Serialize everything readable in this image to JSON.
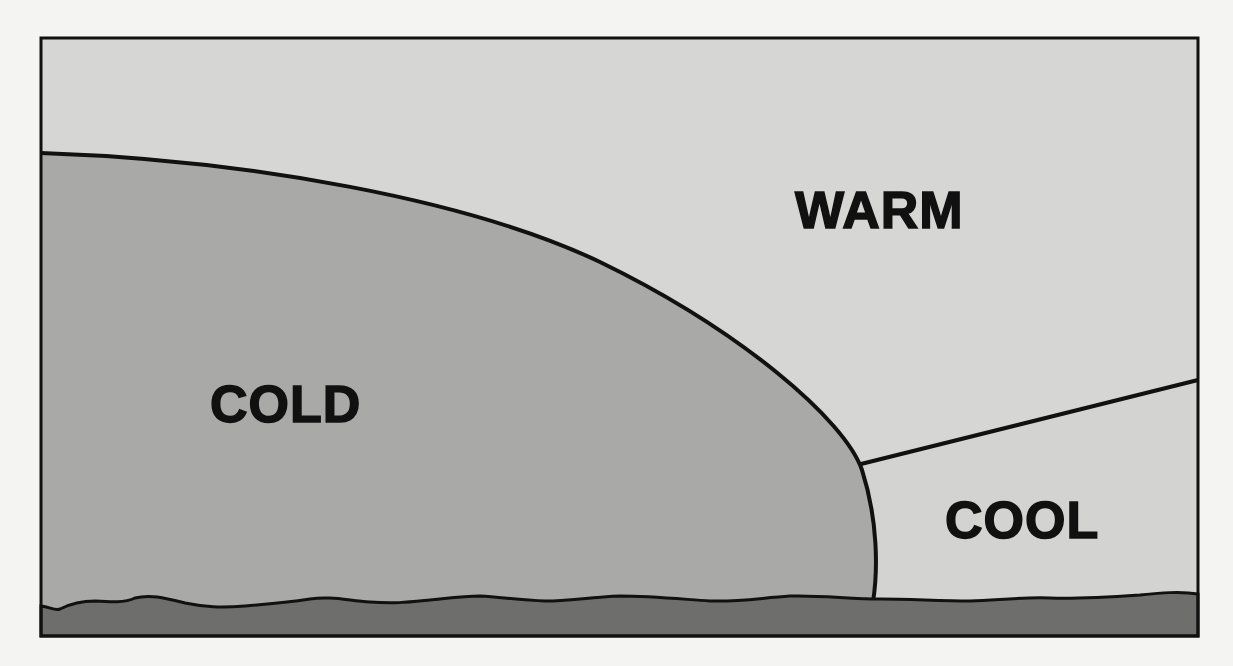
{
  "diagram": {
    "type": "cross-section of air masses at a cold front",
    "colors": {
      "page_background": "#f4f4f2",
      "warm_air": "#d6d6d4",
      "cold_air": "#a9a9a7",
      "cool_air": "#d6d6d4",
      "ground": "#6e6e6c",
      "outline": "#111111"
    },
    "regions": {
      "warm": {
        "label": "WARM"
      },
      "cold": {
        "label": "COLD"
      },
      "cool": {
        "label": "COOL"
      }
    }
  }
}
